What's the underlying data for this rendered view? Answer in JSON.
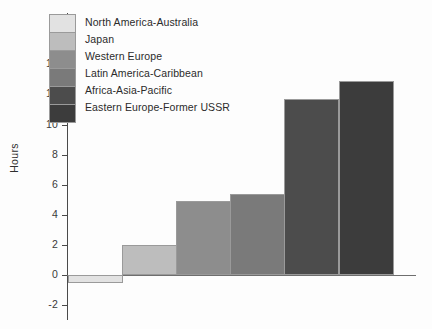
{
  "chart_data": {
    "type": "bar",
    "title": "",
    "xlabel": "",
    "ylabel": "Hours",
    "ylim": [
      -2,
      14
    ],
    "yticks": [
      14,
      12,
      10,
      8,
      6,
      4,
      2,
      0,
      -2
    ],
    "grid": false,
    "legend_position": "upper-left",
    "categories": [
      "North America-Australia",
      "Japan",
      "Western Europe",
      "Latin America-Caribbean",
      "Africa-Asia-Pacific",
      "Eastern Europe-Former USSR"
    ],
    "values": [
      -0.5,
      2.0,
      4.9,
      5.4,
      11.7,
      12.9
    ],
    "colors": [
      "#e2e2e2",
      "#bdbdbd",
      "#8d8d8d",
      "#7a7a7a",
      "#4c4c4c",
      "#3c3c3c"
    ]
  }
}
